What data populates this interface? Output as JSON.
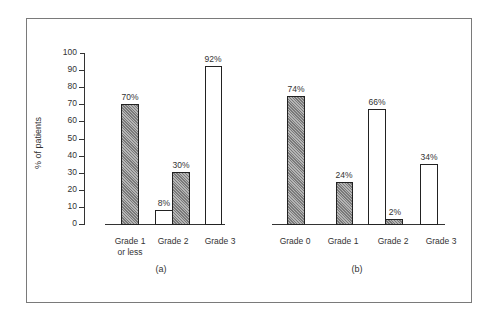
{
  "chart_data": [
    {
      "type": "bar",
      "panel_label": "(a)",
      "ylabel": "% of patients",
      "ylim": [
        0,
        100
      ],
      "yticks": [
        "0",
        "10",
        "20",
        "30",
        "40",
        "50",
        "60",
        "70",
        "80",
        "90",
        "100"
      ],
      "categories": [
        "Grade 1 or less",
        "Grade 2",
        "Grade 3"
      ],
      "series": [
        {
          "name": "open",
          "style": "white",
          "values": [
            null,
            8,
            92
          ]
        },
        {
          "name": "hatched",
          "style": "gray-hatched",
          "values": [
            70,
            30,
            null
          ]
        }
      ],
      "data_labels": [
        "70%",
        "8%",
        "30%",
        "92%"
      ],
      "grid": false,
      "legend": null
    },
    {
      "type": "bar",
      "panel_label": "(b)",
      "ylabel": "% of patients",
      "ylim": [
        0,
        100
      ],
      "categories": [
        "Grade 0",
        "Grade 1",
        "Grade 2",
        "Grade 3"
      ],
      "series": [
        {
          "name": "hatched",
          "style": "gray-hatched",
          "values": [
            74,
            24,
            2,
            null
          ]
        },
        {
          "name": "open",
          "style": "white",
          "values": [
            null,
            null,
            66,
            34
          ]
        }
      ],
      "data_labels": [
        "74%",
        "24%",
        "66%",
        "2%",
        "34%"
      ],
      "grid": false,
      "legend": null
    }
  ],
  "labels": {
    "ylabel": "% of patients",
    "ticks": [
      "0",
      "10",
      "20",
      "30",
      "40",
      "50",
      "60",
      "70",
      "80",
      "90",
      "100"
    ],
    "a": {
      "panel": "(a)",
      "cat1_line1": "Grade 1",
      "cat1_line2": "or less",
      "cat2": "Grade 2",
      "cat3": "Grade 3",
      "v_g1_hatched": "70%",
      "v_g2_open": "8%",
      "v_g2_hatched": "30%",
      "v_g3_open": "92%"
    },
    "b": {
      "panel": "(b)",
      "cat0": "Grade 0",
      "cat1": "Grade 1",
      "cat2": "Grade 2",
      "cat3": "Grade 3",
      "v_g0_hatched": "74%",
      "v_g1_hatched": "24%",
      "v_g2_open": "66%",
      "v_g2_hatched": "2%",
      "v_g3_open": "34%"
    }
  }
}
